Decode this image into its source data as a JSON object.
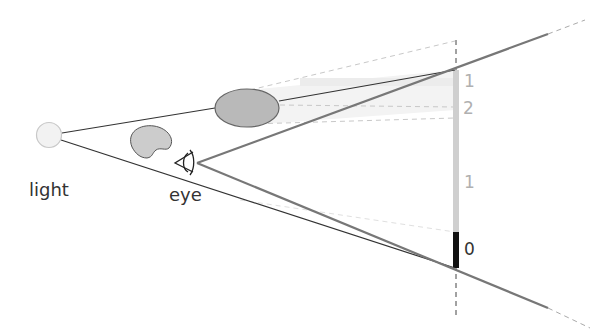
{
  "diagram": {
    "labels": {
      "light": "light",
      "eye": "eye"
    },
    "scale_marks": [
      {
        "text": "1",
        "tone": "light"
      },
      {
        "text": "2",
        "tone": "light"
      },
      {
        "text": "1",
        "tone": "light"
      },
      {
        "text": "0",
        "tone": "dark"
      }
    ],
    "colors": {
      "ray_dark": "#333333",
      "ray_gray": "#777777",
      "bar_light": "#cfcfcf",
      "bar_dark": "#111111",
      "occluder_large": "#b9b9b9",
      "occluder_small": "#cccccc",
      "light_source": "#f0f0f0",
      "dashed": "#bdbdbd"
    }
  }
}
